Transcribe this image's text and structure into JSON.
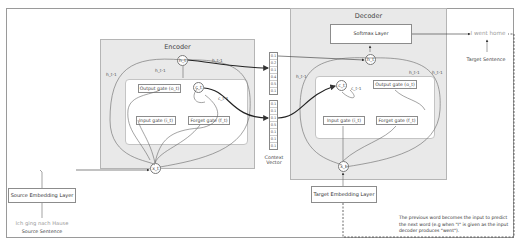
{
  "encoder": {
    "title": "Encoder",
    "hidden_state": "h_t",
    "cell_state": "c_t",
    "input_node": "x_t",
    "gates": {
      "output": "Output gate (o_t)",
      "input": "Input gate (i_t)",
      "forget": "Forget gate (f_t)"
    },
    "labels": {
      "h_prev_left": "h_t-1",
      "h_prev_top": "h_t-1",
      "h_prev_right": "h_t-1",
      "c_prev": "c_t-1"
    }
  },
  "decoder": {
    "title": "Decoder",
    "softmax_label": "Softmax Layer",
    "hidden_state": "h_t",
    "cell_state": "c_t",
    "input_node": "x_t",
    "gates": {
      "output": "Output gate (o_t)",
      "input": "Input gate (i_t)",
      "forget": "Forget gate (f_t)"
    },
    "labels": {
      "h_prev_left": "h_t-1",
      "h_prev_top": "h_t-1",
      "h_prev_right": "h_t-1",
      "c_prev": "c_t-1"
    }
  },
  "context_vector": {
    "caption_line1": "Context",
    "caption_line2": "Vector",
    "top_values": [
      "0.1",
      "0.2",
      "0.1",
      "0.4",
      "0.5",
      "0.1"
    ],
    "bottom_values": [
      "0.1",
      "0.1",
      "0.1",
      "0.5",
      "0.1",
      "0.1",
      "0.1"
    ]
  },
  "source": {
    "embedding_label": "Source Embedding Layer",
    "sentence": "Ich ging nach Hause",
    "sentence_caption": "Source Sentence"
  },
  "target": {
    "embedding_label": "Target Embedding Layer",
    "sentence": "I went home",
    "sentence_caption": "Target Sentence"
  },
  "note": {
    "text": "The previous word becomes the input to predict the next word (e.g when \"I\" is given as the input decoder produces \"went\")."
  },
  "colors": {
    "panel_bg": "#e9e9e9",
    "inner_bg": "#ffffff",
    "wire": "#555555",
    "bold_wire": "#222222",
    "source_sentence": "#9a9a9a",
    "target_sentence": "#9a9a9a"
  }
}
